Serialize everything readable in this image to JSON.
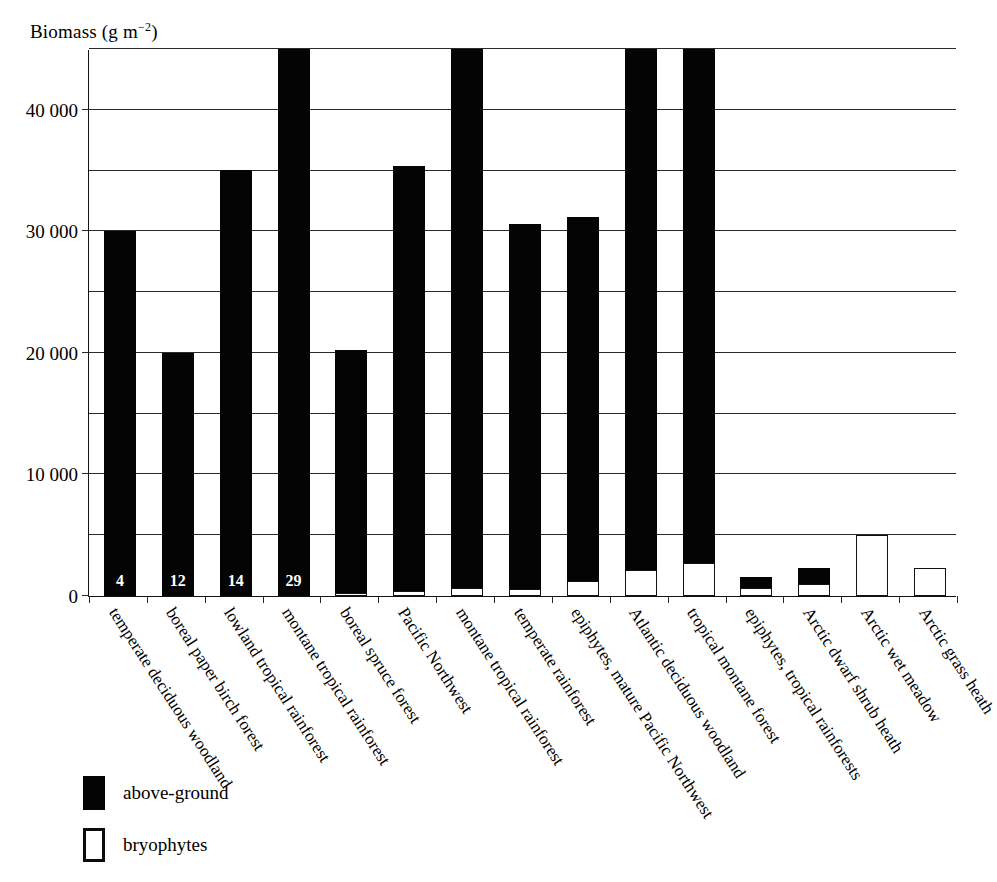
{
  "chart_data": {
    "type": "bar",
    "title": "",
    "ylabel": "Biomass (g m−2)",
    "ylabel_base": "Biomass (g m",
    "ylabel_exp": "−2",
    "ylabel_close": ")",
    "xlabel": "",
    "ylim": [
      0,
      45000
    ],
    "grid": true,
    "gridline_step": 5000,
    "ticks_major": [
      "0",
      "10 000",
      "20 000",
      "30 000",
      "40 000"
    ],
    "tick_values_major": [
      0,
      10000,
      20000,
      30000,
      40000
    ],
    "gridline_values": [
      5000,
      10000,
      15000,
      20000,
      25000,
      30000,
      35000,
      40000,
      45000
    ],
    "legend_position": "bottom-left",
    "legend": [
      {
        "label": "above-ground",
        "style": "filled",
        "color": "#040404"
      },
      {
        "label": "bryophytes",
        "style": "hollow",
        "color": "#ffffff"
      }
    ],
    "categories": [
      "temperate deciduous woodland",
      "boreal paper birch forest",
      "lowland tropical rainforest",
      "montane tropical rainforest",
      "boreal spruce forest",
      "Pacific Northwest",
      "montane tropical rainforest",
      "temperate rainforest",
      "epiphytes, mature Pacific Northwest",
      "Atlantic deciduous woodland",
      "tropical montane forest",
      "epiphytes, tropical rainforests",
      "Arctic dwarf shrub heath",
      "Arctic wet meadow",
      "Arctic grass heath"
    ],
    "series": [
      {
        "name": "above-ground",
        "values": [
          30000,
          20000,
          35000,
          45000,
          20000,
          35000,
          45000,
          30000,
          30000,
          45000,
          45000,
          900,
          1300,
          0,
          0
        ]
      },
      {
        "name": "bryophytes",
        "values": [
          4,
          12,
          14,
          29,
          250,
          400,
          700,
          600,
          1200,
          2100,
          2700,
          700,
          1000,
          5000,
          2300
        ]
      }
    ],
    "bar_value_labels": [
      "4",
      "12",
      "14",
      "29",
      "",
      "",
      "",
      "",
      "",
      "",
      "",
      "",
      "",
      "",
      ""
    ],
    "clipped_at_top": [
      false,
      false,
      false,
      true,
      false,
      false,
      true,
      false,
      false,
      true,
      true,
      false,
      false,
      false,
      false
    ]
  }
}
